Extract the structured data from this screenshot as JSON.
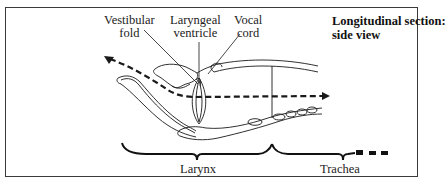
{
  "diagram": {
    "title_line1": "Longitudinal section:",
    "title_line2": "side view",
    "labels": {
      "vestibular_fold_line1": "Vestibular",
      "vestibular_fold_line2": "fold",
      "laryngeal_ventricle_line1": "Laryngeal",
      "laryngeal_ventricle_line2": "ventricle",
      "vocal_cord_line1": "Vocal",
      "vocal_cord_line2": "cord"
    },
    "regions": {
      "larynx": "Larynx",
      "trachea": "Trachea"
    },
    "colors": {
      "ink": "#1a1a1a",
      "border": "#3a3a3a",
      "background": "#ffffff"
    }
  }
}
